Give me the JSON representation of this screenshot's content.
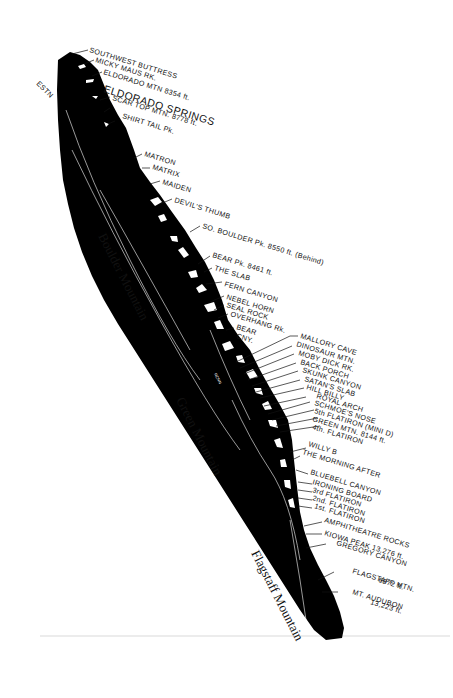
{
  "map": {
    "title": "Boulder Flatirons ridge profile",
    "colors": {
      "ridge": "#000000",
      "background": "#ffffff",
      "text": "#111111",
      "snow": "#ffffff"
    },
    "compass_label": "ESTN",
    "mountain_labels": [
      {
        "id": "boulder",
        "text": "Boulder Mountain"
      },
      {
        "id": "green",
        "text": "Green Mountain"
      },
      {
        "id": "flagstaff",
        "text": "Flagstaff Mountain"
      }
    ],
    "ridge_inner_label": "RCNN",
    "features": [
      {
        "text": "SOUTHWEST BUTTRESS"
      },
      {
        "text": "MICKY MAUS RK."
      },
      {
        "text": "ELDORADO MTN 8354 ft."
      },
      {
        "text": "ELDORADO SPRINGS"
      },
      {
        "text": "SCAR TOP MTN. 8778 ft."
      },
      {
        "text": "SHIRT TAIL Pk."
      },
      {
        "text": "MATRON"
      },
      {
        "text": "MATRIX"
      },
      {
        "text": "MAIDEN"
      },
      {
        "text": "DEVIL'S THUMB"
      },
      {
        "text": "SO. BOULDER Pk. 8550 ft. (Behind)"
      },
      {
        "text": "BEAR Pk. 8461 ft."
      },
      {
        "text": "THE SLAB"
      },
      {
        "text": "FERN CANYON"
      },
      {
        "text": "NEBEL HORN"
      },
      {
        "text": "SEAL ROCK"
      },
      {
        "text": "OVERHANG Rk."
      },
      {
        "text": "BEAR"
      },
      {
        "text": "CNY."
      },
      {
        "text": "MALLORY CAVE"
      },
      {
        "text": "DINOSAUR MTN."
      },
      {
        "text": "MOBY DICK RK."
      },
      {
        "text": "BACK PORCH"
      },
      {
        "text": "SKUNK CANYON"
      },
      {
        "text": "SATAN'S SLAB"
      },
      {
        "text": "HILL BILLY"
      },
      {
        "text": "ROYAL ARCH"
      },
      {
        "text": "SCHMOE'S NOSE"
      },
      {
        "text": "5th FLATIRON (MINI D)"
      },
      {
        "text": "GREEN MTN. 8144 ft."
      },
      {
        "text": "4th. FLATIRON"
      },
      {
        "text": "WILLY B"
      },
      {
        "text": "THE MORNING AFTER"
      },
      {
        "text": "BLUEBELL CANYON"
      },
      {
        "text": "IRONING BOARD"
      },
      {
        "text": "3rd FLATIRON"
      },
      {
        "text": "2nd. FLATIRON"
      },
      {
        "text": "1st. FLATIRON"
      },
      {
        "text": "AMPHITHEATRE ROCKS"
      },
      {
        "text": "KIOWA PEAK 13,276 ft."
      },
      {
        "text": "GREGORY CANYON"
      },
      {
        "text": "FLAGSTAFF MTN."
      },
      {
        "text": "6872 ft."
      },
      {
        "text": "MT. AUDUBON"
      },
      {
        "text": "13,223 ft."
      }
    ]
  }
}
